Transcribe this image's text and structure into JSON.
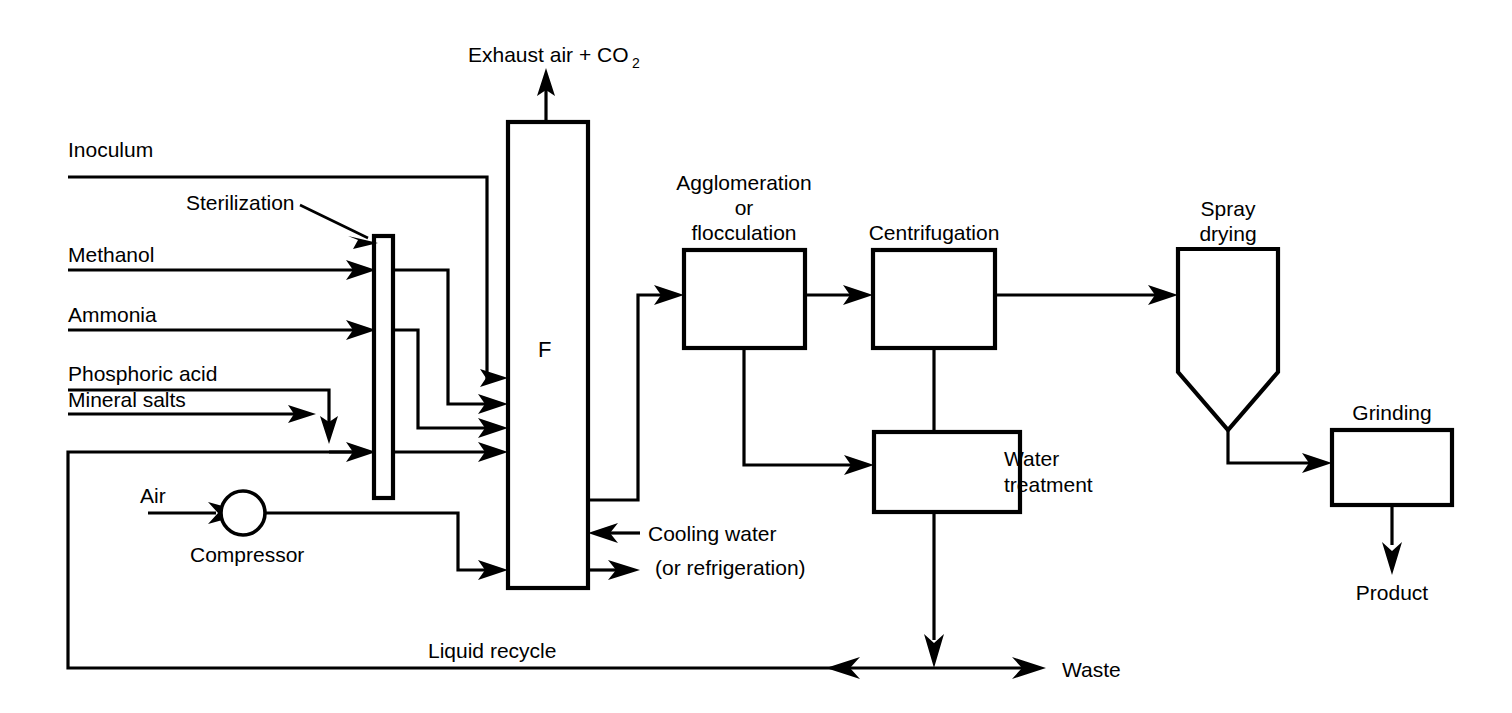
{
  "diagram": {
    "background_color": "#ffffff",
    "line_color": "#000000"
  },
  "labels": {
    "exhaust": "Exhaust air + CO",
    "exhaust_sub": "2",
    "inoculum": "Inoculum",
    "sterilization": "Sterilization",
    "methanol": "Methanol",
    "ammonia": "Ammonia",
    "phosphoric_acid": "Phosphoric acid",
    "mineral_salts": "Mineral salts",
    "air": "Air",
    "compressor": "Compressor",
    "fermenter_letter": "F",
    "agglomeration_line1": "Agglomeration",
    "agglomeration_line2": "or",
    "agglomeration_line3": "flocculation",
    "centrifugation": "Centrifugation",
    "spray_drying_line1": "Spray",
    "spray_drying_line2": "drying",
    "grinding": "Grinding",
    "water_treatment_line1": "Water",
    "water_treatment_line2": "treatment",
    "cooling_water_line1": "Cooling water",
    "cooling_water_line2": "(or refrigeration)",
    "liquid_recycle": "Liquid recycle",
    "waste": "Waste",
    "product": "Product"
  },
  "units": [
    {
      "id": "sterilizer",
      "name": "Sterilization",
      "shape": "narrow-column"
    },
    {
      "id": "fermenter",
      "name": "F",
      "shape": "tall-column"
    },
    {
      "id": "agglomeration",
      "name": "Agglomeration or flocculation",
      "shape": "rectangle"
    },
    {
      "id": "centrifugation",
      "name": "Centrifugation",
      "shape": "rectangle"
    },
    {
      "id": "water-treatment",
      "name": "Water treatment",
      "shape": "rectangle"
    },
    {
      "id": "spray-dryer",
      "name": "Spray drying",
      "shape": "cone-bottom-vessel"
    },
    {
      "id": "grinding",
      "name": "Grinding",
      "shape": "rectangle"
    },
    {
      "id": "compressor",
      "name": "Compressor",
      "shape": "circle"
    }
  ],
  "streams": [
    {
      "id": "inoculum",
      "label": "Inoculum",
      "from": "feed",
      "to": "fermenter"
    },
    {
      "id": "methanol",
      "label": "Methanol",
      "from": "feed",
      "to": "sterilizer"
    },
    {
      "id": "ammonia",
      "label": "Ammonia",
      "from": "feed",
      "to": "sterilizer"
    },
    {
      "id": "phosphoric-acid",
      "label": "Phosphoric acid",
      "from": "feed",
      "to": "sterilizer"
    },
    {
      "id": "mineral-salts",
      "label": "Mineral salts",
      "from": "feed",
      "to": "sterilizer"
    },
    {
      "id": "air",
      "label": "Air",
      "from": "feed",
      "to": "compressor"
    },
    {
      "id": "exhaust",
      "label": "Exhaust air + CO2",
      "from": "fermenter",
      "to": "atmosphere"
    },
    {
      "id": "cooling-water-in",
      "label": "Cooling water (or refrigeration)",
      "from": "utility",
      "to": "fermenter"
    },
    {
      "id": "cooling-water-out",
      "label": "Cooling water return",
      "from": "fermenter",
      "to": "utility"
    },
    {
      "id": "broth",
      "label": "Fermentation broth",
      "from": "fermenter",
      "to": "agglomeration"
    },
    {
      "id": "agglom-to-centrifuge",
      "label": "",
      "from": "agglomeration",
      "to": "centrifugation"
    },
    {
      "id": "agglom-to-water",
      "label": "",
      "from": "agglomeration",
      "to": "water-treatment"
    },
    {
      "id": "centrifuge-to-water",
      "label": "",
      "from": "centrifugation",
      "to": "water-treatment"
    },
    {
      "id": "centrifuge-to-dryer",
      "label": "",
      "from": "centrifugation",
      "to": "spray-dryer"
    },
    {
      "id": "dryer-to-grinding",
      "label": "",
      "from": "spray-dryer",
      "to": "grinding"
    },
    {
      "id": "product",
      "label": "Product",
      "from": "grinding",
      "to": "product"
    },
    {
      "id": "waste",
      "label": "Waste",
      "from": "water-treatment",
      "to": "waste"
    },
    {
      "id": "liquid-recycle",
      "label": "Liquid recycle",
      "from": "water-treatment",
      "to": "fermenter"
    }
  ]
}
